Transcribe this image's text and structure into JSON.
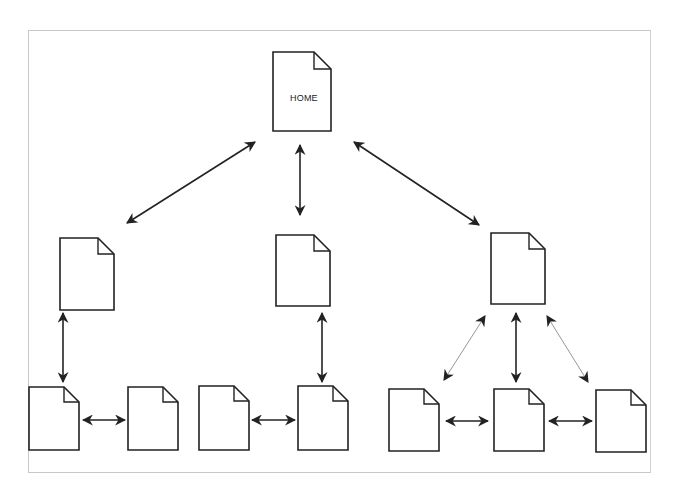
{
  "diagram": {
    "type": "site-hierarchy",
    "colors": {
      "stroke": "#222222",
      "light_arrow": "#8a8a8a",
      "frame": "#c8c8c8",
      "background": "#ffffff"
    },
    "nodes": [
      {
        "id": "home",
        "label": "HOME",
        "x": 273,
        "y": 52,
        "w": 58,
        "h": 79,
        "level": 0
      },
      {
        "id": "mid-left",
        "label": "",
        "x": 60,
        "y": 238,
        "w": 54,
        "h": 72,
        "level": 1
      },
      {
        "id": "mid-center",
        "label": "",
        "x": 276,
        "y": 235,
        "w": 54,
        "h": 71,
        "level": 1
      },
      {
        "id": "mid-right",
        "label": "",
        "x": 491,
        "y": 233,
        "w": 54,
        "h": 71,
        "level": 1
      },
      {
        "id": "leaf-1",
        "label": "",
        "x": 29,
        "y": 387,
        "w": 50,
        "h": 63,
        "level": 2
      },
      {
        "id": "leaf-2",
        "label": "",
        "x": 128,
        "y": 387,
        "w": 50,
        "h": 63,
        "level": 2
      },
      {
        "id": "leaf-3",
        "label": "",
        "x": 199,
        "y": 386,
        "w": 50,
        "h": 64,
        "level": 2
      },
      {
        "id": "leaf-4",
        "label": "",
        "x": 298,
        "y": 386,
        "w": 50,
        "h": 64,
        "level": 2
      },
      {
        "id": "leaf-5",
        "label": "",
        "x": 389,
        "y": 389,
        "w": 50,
        "h": 62,
        "level": 2
      },
      {
        "id": "leaf-6",
        "label": "",
        "x": 494,
        "y": 389,
        "w": 50,
        "h": 62,
        "level": 2
      },
      {
        "id": "leaf-7",
        "label": "",
        "x": 596,
        "y": 390,
        "w": 50,
        "h": 62,
        "level": 2
      }
    ],
    "edges": [
      {
        "from": "home",
        "to": "mid-left",
        "x1": 255,
        "y1": 142,
        "x2": 127,
        "y2": 223,
        "style": "bold"
      },
      {
        "from": "home",
        "to": "mid-center",
        "x1": 300,
        "y1": 145,
        "x2": 300,
        "y2": 215,
        "style": "bold"
      },
      {
        "from": "home",
        "to": "mid-right",
        "x1": 354,
        "y1": 142,
        "x2": 479,
        "y2": 225,
        "style": "bold"
      },
      {
        "from": "mid-left",
        "to": "leaf-1",
        "x1": 63,
        "y1": 313,
        "x2": 63,
        "y2": 382,
        "style": "bold"
      },
      {
        "from": "mid-center",
        "to": "leaf-4",
        "x1": 322,
        "y1": 313,
        "x2": 322,
        "y2": 382,
        "style": "bold"
      },
      {
        "from": "mid-right",
        "to": "leaf-5",
        "x1": 485,
        "y1": 316,
        "x2": 444,
        "y2": 380,
        "style": "light"
      },
      {
        "from": "mid-right",
        "to": "leaf-6",
        "x1": 516,
        "y1": 313,
        "x2": 516,
        "y2": 382,
        "style": "bold"
      },
      {
        "from": "mid-right",
        "to": "leaf-7",
        "x1": 547,
        "y1": 316,
        "x2": 588,
        "y2": 382,
        "style": "light"
      },
      {
        "from": "leaf-1",
        "to": "leaf-2",
        "x1": 83,
        "y1": 420,
        "x2": 125,
        "y2": 420,
        "style": "bold"
      },
      {
        "from": "leaf-3",
        "to": "leaf-4",
        "x1": 252,
        "y1": 420,
        "x2": 295,
        "y2": 420,
        "style": "bold"
      },
      {
        "from": "leaf-5",
        "to": "leaf-6",
        "x1": 446,
        "y1": 421,
        "x2": 488,
        "y2": 421,
        "style": "bold"
      },
      {
        "from": "leaf-6",
        "to": "leaf-7",
        "x1": 549,
        "y1": 421,
        "x2": 592,
        "y2": 421,
        "style": "bold"
      }
    ]
  },
  "labels": {
    "home": "HOME"
  }
}
